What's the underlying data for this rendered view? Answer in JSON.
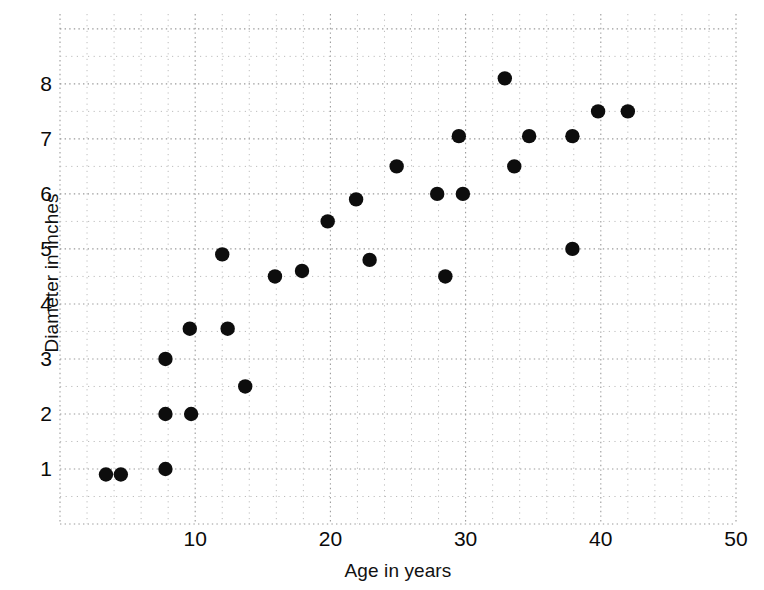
{
  "chart_data": {
    "type": "scatter",
    "title": "",
    "xlabel": "Age in years",
    "ylabel": "Diameter in inches",
    "xlim": [
      0,
      50
    ],
    "ylim": [
      0,
      9.27
    ],
    "xticks": [
      10,
      20,
      30,
      40,
      50
    ],
    "yticks": [
      1,
      2,
      3,
      4,
      5,
      6,
      7,
      8
    ],
    "grid": "dotted-minor-and-major",
    "grid_major_x_step": 10,
    "grid_minor_x_step": 2,
    "grid_major_y_step": 1,
    "grid_minor_y_step": 0.5,
    "legend": "none",
    "marker": "filled-circle",
    "marker_color": "#0d0d0d",
    "points": [
      {
        "x": 3.4,
        "y": 0.9
      },
      {
        "x": 4.5,
        "y": 0.9
      },
      {
        "x": 7.8,
        "y": 1.0
      },
      {
        "x": 7.8,
        "y": 2.0
      },
      {
        "x": 9.7,
        "y": 2.0
      },
      {
        "x": 7.8,
        "y": 3.0
      },
      {
        "x": 9.6,
        "y": 3.55
      },
      {
        "x": 12.4,
        "y": 3.55
      },
      {
        "x": 13.7,
        "y": 2.5
      },
      {
        "x": 12.0,
        "y": 4.9
      },
      {
        "x": 15.9,
        "y": 4.5
      },
      {
        "x": 17.9,
        "y": 4.6
      },
      {
        "x": 19.8,
        "y": 5.5
      },
      {
        "x": 21.9,
        "y": 5.9
      },
      {
        "x": 22.9,
        "y": 4.8
      },
      {
        "x": 24.9,
        "y": 6.5
      },
      {
        "x": 27.9,
        "y": 6.0
      },
      {
        "x": 28.5,
        "y": 4.5
      },
      {
        "x": 29.8,
        "y": 6.0
      },
      {
        "x": 29.5,
        "y": 7.05
      },
      {
        "x": 32.9,
        "y": 8.1
      },
      {
        "x": 33.6,
        "y": 6.5
      },
      {
        "x": 34.7,
        "y": 7.05
      },
      {
        "x": 37.9,
        "y": 5.0
      },
      {
        "x": 37.9,
        "y": 7.05
      },
      {
        "x": 39.8,
        "y": 7.5
      },
      {
        "x": 42.0,
        "y": 7.5
      }
    ]
  },
  "axes": {
    "x_tick_labels": [
      "10",
      "20",
      "30",
      "40",
      "50"
    ],
    "y_tick_labels": [
      "1",
      "2",
      "3",
      "4",
      "5",
      "6",
      "7",
      "8"
    ],
    "x_title": "Age in years",
    "y_title": "Diameter in inches"
  }
}
